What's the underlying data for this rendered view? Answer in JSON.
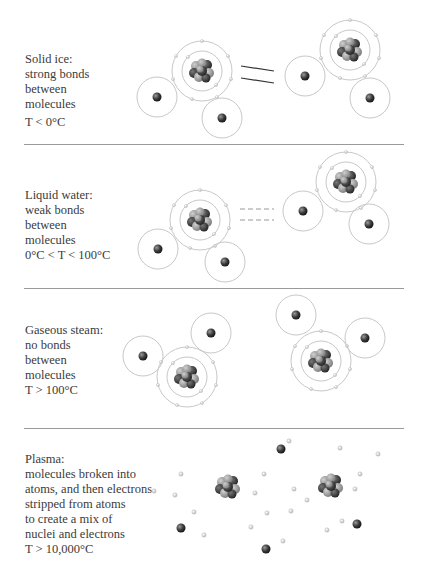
{
  "colors": {
    "orbit": "#c8c8c8",
    "nucleus_dark": "#2e2e2e",
    "nucleus_light": "#9a9a9a",
    "divider": "#9a9a9a",
    "text": "#3b3b3b"
  },
  "panels": [
    {
      "id": "solid",
      "lines": [
        "Solid ice:",
        "strong bonds",
        "between",
        "molecules"
      ],
      "temperature": "T < 0°C",
      "bond_type": "strong-solid-lines"
    },
    {
      "id": "liquid",
      "lines": [
        "Liquid water:",
        "weak bonds",
        "between",
        "molecules"
      ],
      "temperature": "0°C < T < 100°C",
      "bond_type": "weak-dashed-lines"
    },
    {
      "id": "gas",
      "lines": [
        "Gaseous steam:",
        "no bonds",
        "between",
        "molecules"
      ],
      "temperature": "T > 100°C",
      "bond_type": "none"
    },
    {
      "id": "plasma",
      "lines": [
        "Plasma:",
        "molecules broken into",
        "atoms, and then electrons",
        "stripped from atoms",
        "to create a mix of",
        "nuclei and electrons"
      ],
      "temperature": "T > 10,000°C",
      "bond_type": "none"
    }
  ]
}
